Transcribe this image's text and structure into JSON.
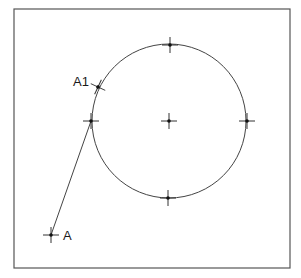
{
  "diagram": {
    "frame": {
      "x": 14,
      "y": 9,
      "width": 276,
      "height": 259,
      "stroke": "#555555"
    },
    "circle": {
      "cx": 169,
      "cy": 121,
      "r": 77,
      "stroke": "#444444"
    },
    "points": [
      {
        "id": "center",
        "x": 169,
        "y": 121,
        "label": ""
      },
      {
        "id": "top",
        "x": 170,
        "y": 45,
        "label": ""
      },
      {
        "id": "right",
        "x": 247,
        "y": 121,
        "label": ""
      },
      {
        "id": "bottom",
        "x": 168,
        "y": 198,
        "label": ""
      },
      {
        "id": "left",
        "x": 91,
        "y": 121,
        "label": ""
      },
      {
        "id": "A1",
        "x": 98,
        "y": 87,
        "label": "A1"
      },
      {
        "id": "A",
        "x": 51,
        "y": 235,
        "label": "A"
      }
    ],
    "line": {
      "from": "A",
      "to": "left"
    },
    "labels": {
      "A1": "A1",
      "A": "A"
    }
  }
}
